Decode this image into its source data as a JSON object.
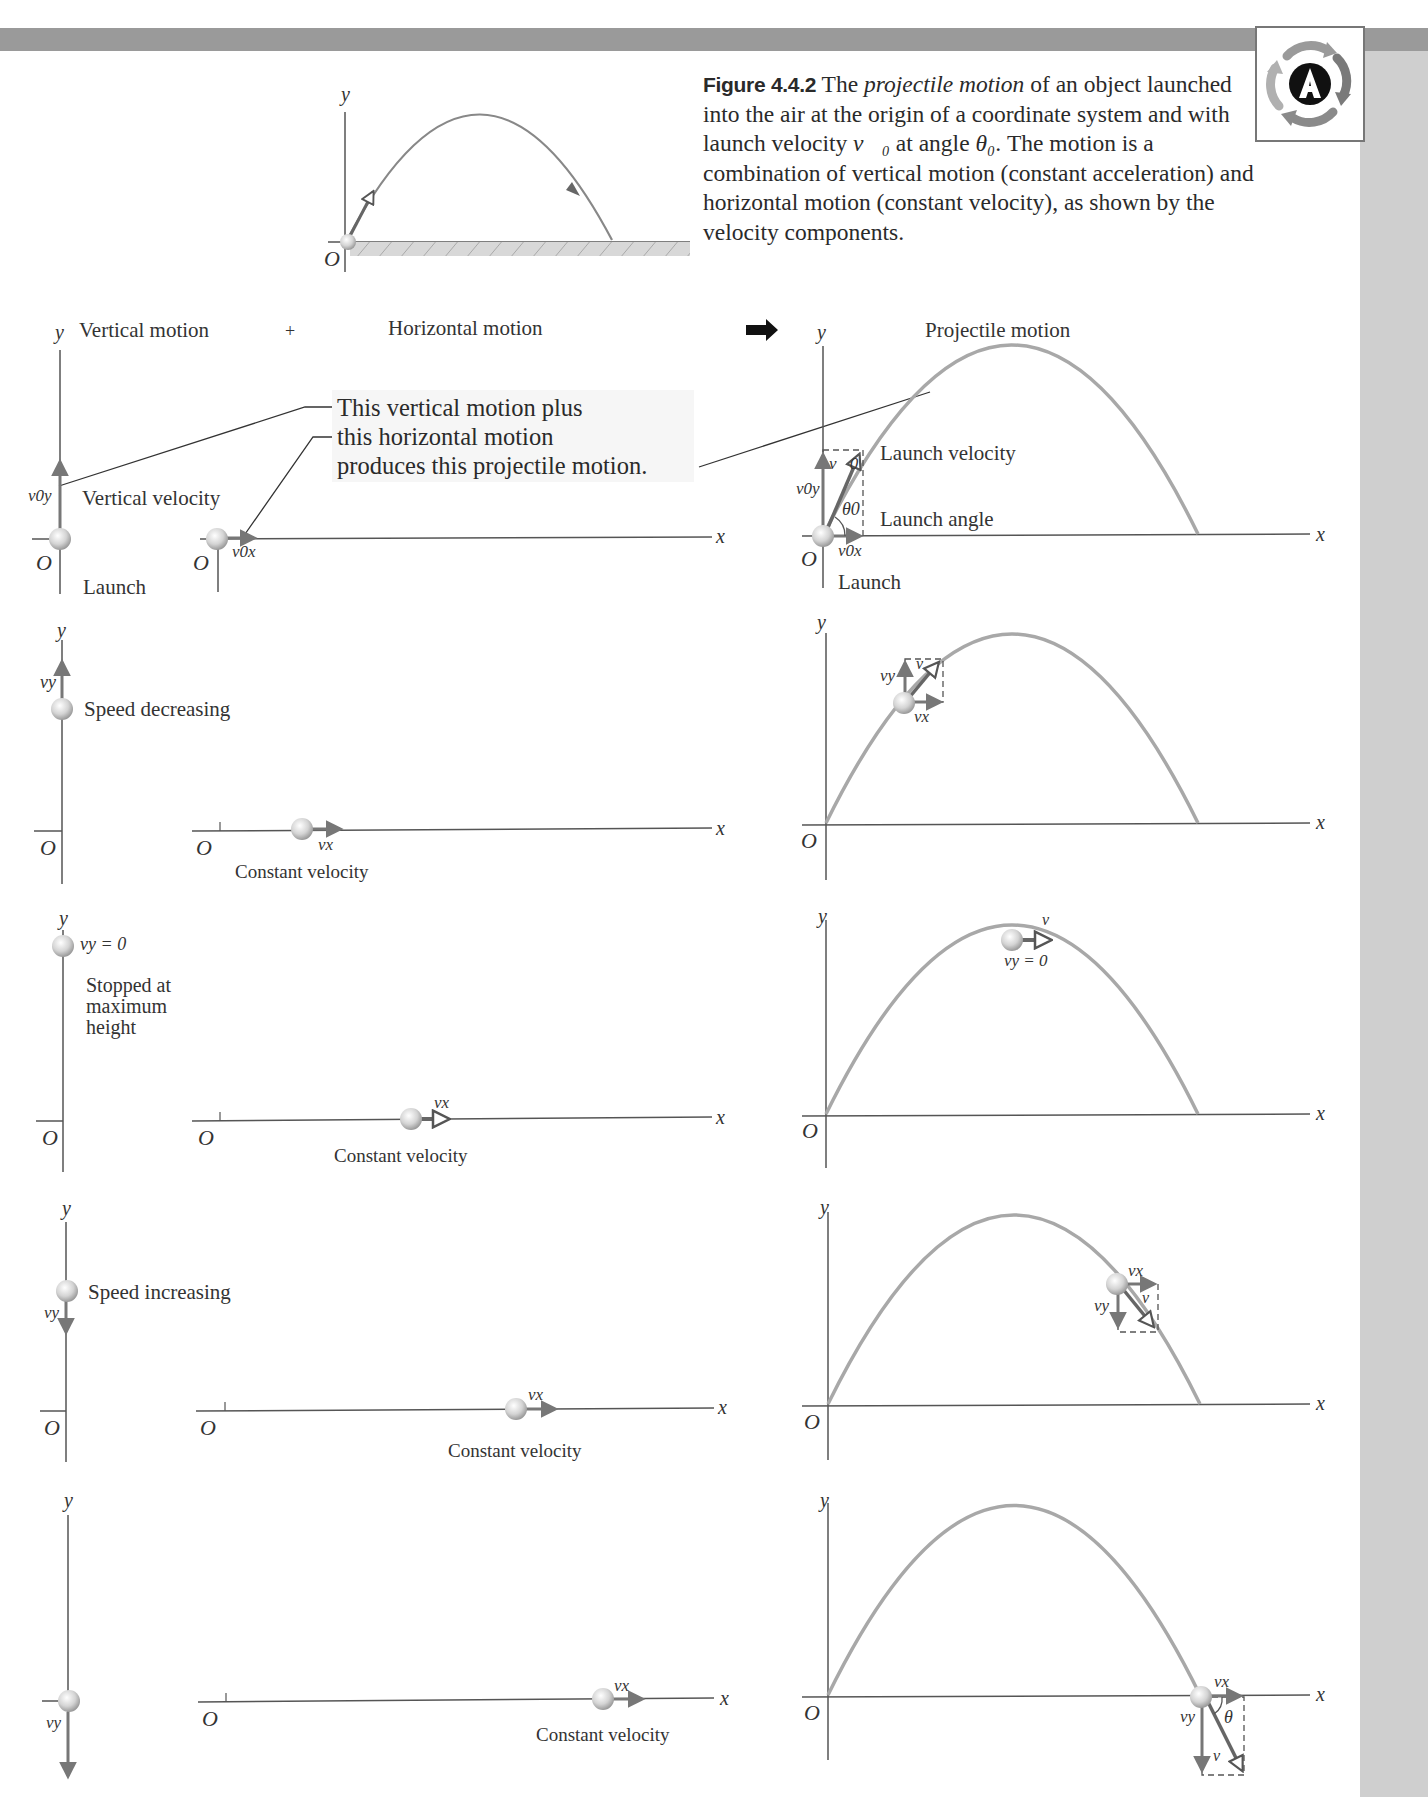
{
  "page": {
    "logo": {
      "icon": "activity-A-icon",
      "letter": "A"
    },
    "colors": {
      "trajectory": "#a8a8a8",
      "axes": "#555555",
      "sidebar": "#cfcfcf",
      "topbar": "#9a9a9a"
    }
  },
  "caption": {
    "figure_label": "Figure 4.4.2",
    "text_1": "The ",
    "text_italic": "projectile motion",
    "text_2": " of an object launched into the air at the origin of a coordinate system and with launch velocity ",
    "v0": "v⃗₀",
    "text_3": " at angle ",
    "theta0": "θ₀",
    "text_4": ". The motion is a combination of vertical motion (constant acceleration) and horizontal motion (constant velocity), as shown by the velocity components."
  },
  "top_figure": {
    "y_axis": "y",
    "origin": "O"
  },
  "headers": {
    "vertical": "Vertical motion",
    "plus": "+",
    "horizontal": "Horizontal motion",
    "projectile": "Projectile motion",
    "y_axis": "y"
  },
  "callout": {
    "line1": "This vertical motion plus",
    "line2": "this horizontal motion",
    "line3": "produces this projectile motion."
  },
  "axis_labels": {
    "x": "x",
    "y": "y",
    "origin": "O"
  },
  "rows": [
    {
      "vertical_note": "Vertical velocity",
      "vertical_sublabel": "Launch",
      "vy_label": "v0y",
      "vx_label": "v0x",
      "horizontal_note": "",
      "projectile_labels": [
        "Launch velocity",
        "Launch angle",
        "Launch"
      ],
      "projectile_vector": "v⃗0",
      "projectile_angle": "θ0",
      "projectile_vy": "v0y",
      "projectile_vx": "v0x"
    },
    {
      "vertical_note": "Speed decreasing",
      "vy_label": "vy",
      "vx_label": "vx",
      "horizontal_note": "Constant velocity",
      "projectile_vy": "vy",
      "projectile_vx": "vx",
      "projectile_vector": "v⃗"
    },
    {
      "vertical_note_line1": "Stopped at",
      "vertical_note_line2": "maximum",
      "vertical_note_line3": "height",
      "vy_label": "vy = 0",
      "vx_label": "vx",
      "horizontal_note": "Constant velocity",
      "projectile_vector": "v⃗",
      "projectile_vy": "vy = 0"
    },
    {
      "vertical_note": "Speed increasing",
      "vy_label": "vy",
      "vx_label": "vx",
      "horizontal_note": "Constant velocity",
      "projectile_vy": "vy",
      "projectile_vx": "vx",
      "projectile_vector": "v⃗"
    },
    {
      "vertical_note": "",
      "vy_label": "vy",
      "vx_label": "vx",
      "horizontal_note": "Constant velocity",
      "projectile_vy": "vy",
      "projectile_vx": "vx",
      "projectile_vector": "v⃗",
      "projectile_angle": "θ"
    }
  ]
}
